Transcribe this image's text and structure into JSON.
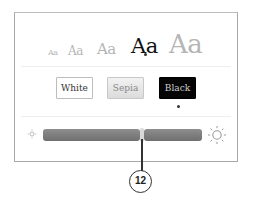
{
  "font_sizes": {
    "items": [
      {
        "label": "Aa",
        "size_px": 8
      },
      {
        "label": "Aa",
        "size_px": 12
      },
      {
        "label": "Aa",
        "size_px": 15
      },
      {
        "label": "Aa",
        "size_px": 21
      },
      {
        "label": "Aa",
        "size_px": 25
      }
    ],
    "selected_index": 3
  },
  "themes": {
    "items": [
      {
        "label": "White"
      },
      {
        "label": "Sepia"
      },
      {
        "label": "Black"
      }
    ],
    "selected_index": 2
  },
  "brightness": {
    "min_icon": "sun-small-icon",
    "max_icon": "sun-large-icon",
    "value_percent": 60
  },
  "callout": {
    "label": "12"
  },
  "colors": {
    "selected_text": "#111111",
    "unselected_text": "#b5b5b5",
    "slider_track": "#7d7d7d",
    "black_theme_bg": "#050505"
  }
}
